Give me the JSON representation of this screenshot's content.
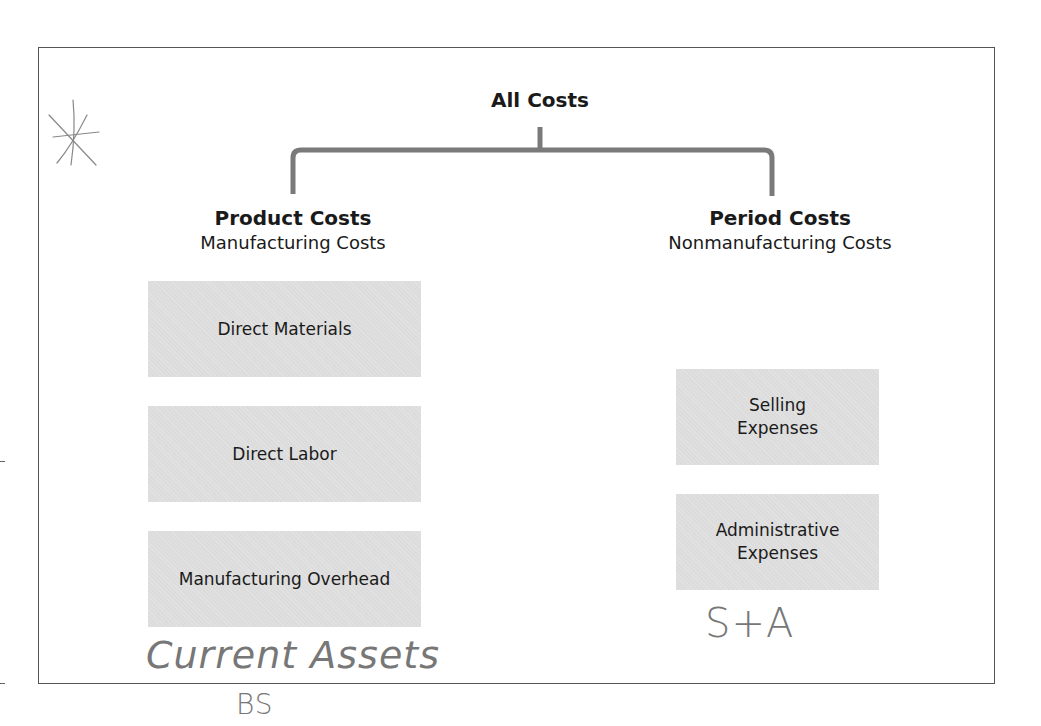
{
  "diagram": {
    "root": "All Costs",
    "branches": [
      {
        "title": "Product Costs",
        "subtitle": "Manufacturing Costs",
        "items": [
          "Direct Materials",
          "Direct Labor",
          "Manufacturing Overhead"
        ]
      },
      {
        "title": "Period Costs",
        "subtitle": "Nonmanufacturing Costs",
        "items": [
          "Selling\nExpenses",
          "Administrative\nExpenses"
        ]
      }
    ]
  },
  "annotations": {
    "asterisk": "*",
    "product_note": "Current Assets",
    "product_note_2": "BS",
    "period_note": "S+A"
  },
  "colors": {
    "connector": "#7a7a7a",
    "box_fill": "#dcdcdc",
    "frame": "#555555"
  }
}
